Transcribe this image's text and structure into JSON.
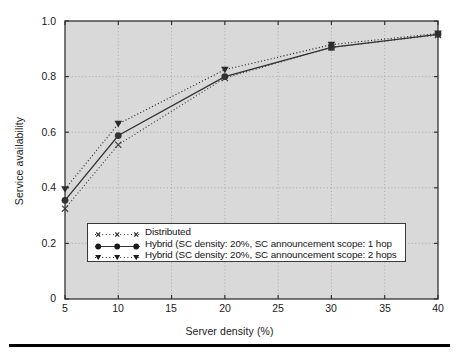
{
  "chart_data": {
    "type": "line",
    "title": "",
    "xlabel": "Server density (%)",
    "ylabel": "Service availability",
    "xlim": [
      5,
      40
    ],
    "ylim": [
      0,
      1.0
    ],
    "xticks": [
      5,
      10,
      15,
      20,
      25,
      30,
      35,
      40
    ],
    "xtick_labels": [
      "5",
      "10",
      "15",
      "20",
      "25",
      "30",
      "35",
      "40"
    ],
    "yticks": [
      0,
      0.2,
      0.4,
      0.6,
      0.8,
      1.0
    ],
    "ytick_labels": [
      "0",
      "0.2",
      "0.4",
      "0.6",
      "0.8",
      "1.0"
    ],
    "grid": true,
    "grid_style": "dotted",
    "legend_position": "lower center",
    "x": [
      5,
      10,
      20,
      30,
      40
    ],
    "series": [
      {
        "name": "Distributed",
        "marker": "x",
        "linestyle": "dotted",
        "color": "#404040",
        "values": [
          0.325,
          0.555,
          0.795,
          0.905,
          0.95
        ]
      },
      {
        "name": "Hybrid (SC density: 20%, SC announcement scope: 1 hop",
        "marker": "circle",
        "linestyle": "solid",
        "color": "#333333",
        "values": [
          0.355,
          0.588,
          0.8,
          0.905,
          0.952
        ]
      },
      {
        "name": "Hybrid (SC density: 20%, SC announcement scope: 2 hops",
        "marker": "triangle-down",
        "linestyle": "dotted",
        "color": "#2b2b2b",
        "values": [
          0.395,
          0.63,
          0.825,
          0.915,
          0.955
        ]
      }
    ]
  },
  "figure": {
    "plot_background": "#d9d9d9",
    "axes_color": "#333333",
    "grid_color": "#9a9a9a",
    "page_background": "#ffffff"
  },
  "legend": {
    "entries": [
      {
        "marker": "x-marker",
        "label": "Distributed"
      },
      {
        "marker": "circle-marker",
        "label": "Hybrid (SC density: 20%, SC announcement scope: 1 hop"
      },
      {
        "marker": "triangle-marker",
        "label": "Hybrid (SC density: 20%, SC announcement scope: 2 hops"
      }
    ]
  }
}
